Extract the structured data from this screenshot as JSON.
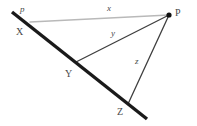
{
  "figure": {
    "kind": "geometry-diagram",
    "background_color": "#ffffff",
    "width": 197,
    "height": 126,
    "line_name_label": "p",
    "vertices": {
      "p_right": "P",
      "x_point": "X",
      "y_point": "Y",
      "z_point": "Z"
    },
    "segments": {
      "x": "x",
      "y": "y",
      "z": "z"
    },
    "colors": {
      "thick_line": "#1a1a1a",
      "segment_x": "#b9b9b9",
      "segment_y": "#3f3f3f",
      "segment_z": "#3f3f3f",
      "vertex_dot": "#111111",
      "text": "#4a4a4a"
    },
    "geometry": {
      "thick_line_start": [
        12,
        12
      ],
      "thick_line_end": [
        147,
        119
      ],
      "point_P": [
        169,
        15
      ],
      "point_X": [
        30,
        22
      ],
      "point_Y": [
        76,
        62
      ],
      "point_Z": [
        128,
        104
      ]
    }
  }
}
